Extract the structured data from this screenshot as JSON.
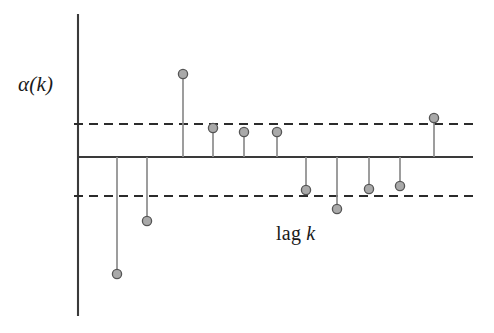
{
  "figure": {
    "title": "",
    "background_color": "#ffffff",
    "width": 494,
    "height": 333
  },
  "labels": {
    "ylabel_text": "α(k)",
    "xlabel_roman": "lag",
    "xlabel_italic": "k"
  },
  "colors": {
    "axis": "#3a3a3a",
    "baseline": "#3a3a3a",
    "confidence_band": "#2b2b2b",
    "stem_line": "#8c8c8c",
    "marker_fill": "#a9a9a9",
    "marker_stroke": "#555555"
  },
  "chart_data": {
    "type": "line",
    "plot_kind": "stem",
    "xlabel": "lag k",
    "ylabel": "α(k)",
    "grid": false,
    "legend": null,
    "axis_ticks_shown": false,
    "x": [
      1,
      2,
      3,
      4,
      5,
      6,
      7,
      8,
      9,
      10,
      11
    ],
    "categories": [
      "1",
      "2",
      "3",
      "4",
      "5",
      "6",
      "7",
      "8",
      "9",
      "10",
      "11"
    ],
    "values": [
      -0.74,
      -0.4,
      0.63,
      0.22,
      0.19,
      0.19,
      -0.26,
      -0.39,
      -0.25,
      -0.22,
      0.3
    ],
    "series": [
      {
        "name": "alpha(k)",
        "values": [
          -0.74,
          -0.4,
          0.63,
          0.22,
          0.19,
          0.19,
          -0.26,
          -0.39,
          -0.25,
          -0.22,
          0.3
        ]
      }
    ],
    "confidence_bounds": {
      "upper": 0.25,
      "lower": -0.25,
      "style": "dashed"
    },
    "ylim": [
      -0.95,
      0.95
    ],
    "xlim": [
      0,
      12
    ],
    "pixel_geometry": {
      "axis_x": 78,
      "axis_y_top": 14,
      "axis_y_bottom": 316,
      "baseline_y": 157,
      "baseline_x_end": 473,
      "band_upper_y": 124,
      "band_lower_y": 196,
      "band_x_end": 478,
      "marker_radius": 4.6,
      "stems": [
        {
          "x": 117,
          "y": 274
        },
        {
          "x": 147,
          "y": 221
        },
        {
          "x": 183,
          "y": 74
        },
        {
          "x": 213,
          "y": 128
        },
        {
          "x": 244,
          "y": 132
        },
        {
          "x": 277,
          "y": 132
        },
        {
          "x": 306,
          "y": 190
        },
        {
          "x": 337,
          "y": 209
        },
        {
          "x": 369,
          "y": 189
        },
        {
          "x": 400,
          "y": 186
        },
        {
          "x": 434,
          "y": 118
        }
      ]
    }
  }
}
